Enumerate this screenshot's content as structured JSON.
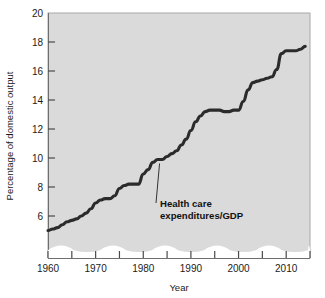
{
  "chart_data": {
    "type": "line",
    "title": "",
    "xlabel": "Year",
    "ylabel": "Percentage of domestic output",
    "xlim": [
      1960,
      2015
    ],
    "ylim": [
      4.4,
      20
    ],
    "y_axis_break": true,
    "grid": false,
    "legend_position": "none",
    "x_ticks": [
      1960,
      1965,
      1970,
      1975,
      1980,
      1985,
      1990,
      1995,
      2000,
      2005,
      2010,
      2015
    ],
    "x_tick_labels": [
      "1960",
      "",
      "1970",
      "",
      "1980",
      "",
      "1990",
      "",
      "2000",
      "",
      "2010",
      ""
    ],
    "x_labeled_ticks": [
      "1960",
      "1970",
      "1980",
      "1990",
      "2000",
      "2010"
    ],
    "y_ticks": [
      6,
      8,
      10,
      12,
      14,
      16,
      18,
      20
    ],
    "y_tick_labels": [
      "6",
      "8",
      "10",
      "12",
      "14",
      "16",
      "18",
      "20"
    ],
    "series": [
      {
        "name": "Health care expenditures/GDP",
        "color": "#2b2b2b",
        "x": [
          1960,
          1961,
          1962,
          1963,
          1964,
          1965,
          1966,
          1967,
          1968,
          1969,
          1970,
          1971,
          1972,
          1973,
          1974,
          1975,
          1976,
          1977,
          1978,
          1979,
          1980,
          1981,
          1982,
          1983,
          1984,
          1985,
          1986,
          1987,
          1988,
          1989,
          1990,
          1991,
          1992,
          1993,
          1994,
          1995,
          1996,
          1997,
          1998,
          1999,
          2000,
          2001,
          2002,
          2003,
          2004,
          2005,
          2006,
          2007,
          2008,
          2009,
          2010,
          2011,
          2012,
          2013,
          2014
        ],
        "values": [
          5.0,
          5.1,
          5.2,
          5.4,
          5.6,
          5.7,
          5.8,
          6.0,
          6.2,
          6.5,
          6.9,
          7.1,
          7.2,
          7.2,
          7.4,
          7.9,
          8.1,
          8.2,
          8.2,
          8.2,
          8.9,
          9.2,
          9.7,
          9.9,
          9.9,
          10.1,
          10.3,
          10.5,
          10.9,
          11.3,
          11.9,
          12.5,
          12.9,
          13.2,
          13.3,
          13.3,
          13.3,
          13.2,
          13.2,
          13.3,
          13.3,
          13.9,
          14.7,
          15.2,
          15.3,
          15.4,
          15.5,
          15.6,
          16.1,
          17.2,
          17.4,
          17.4,
          17.4,
          17.5,
          17.7
        ]
      }
    ],
    "annotations": [
      {
        "text_line1": "Health care",
        "text_line2": "expenditures/GDP",
        "points_to_year": 1983,
        "points_to_value": 9.9
      }
    ]
  },
  "axis": {
    "y_title": "Percentage of domestic output",
    "x_title": "Year"
  }
}
